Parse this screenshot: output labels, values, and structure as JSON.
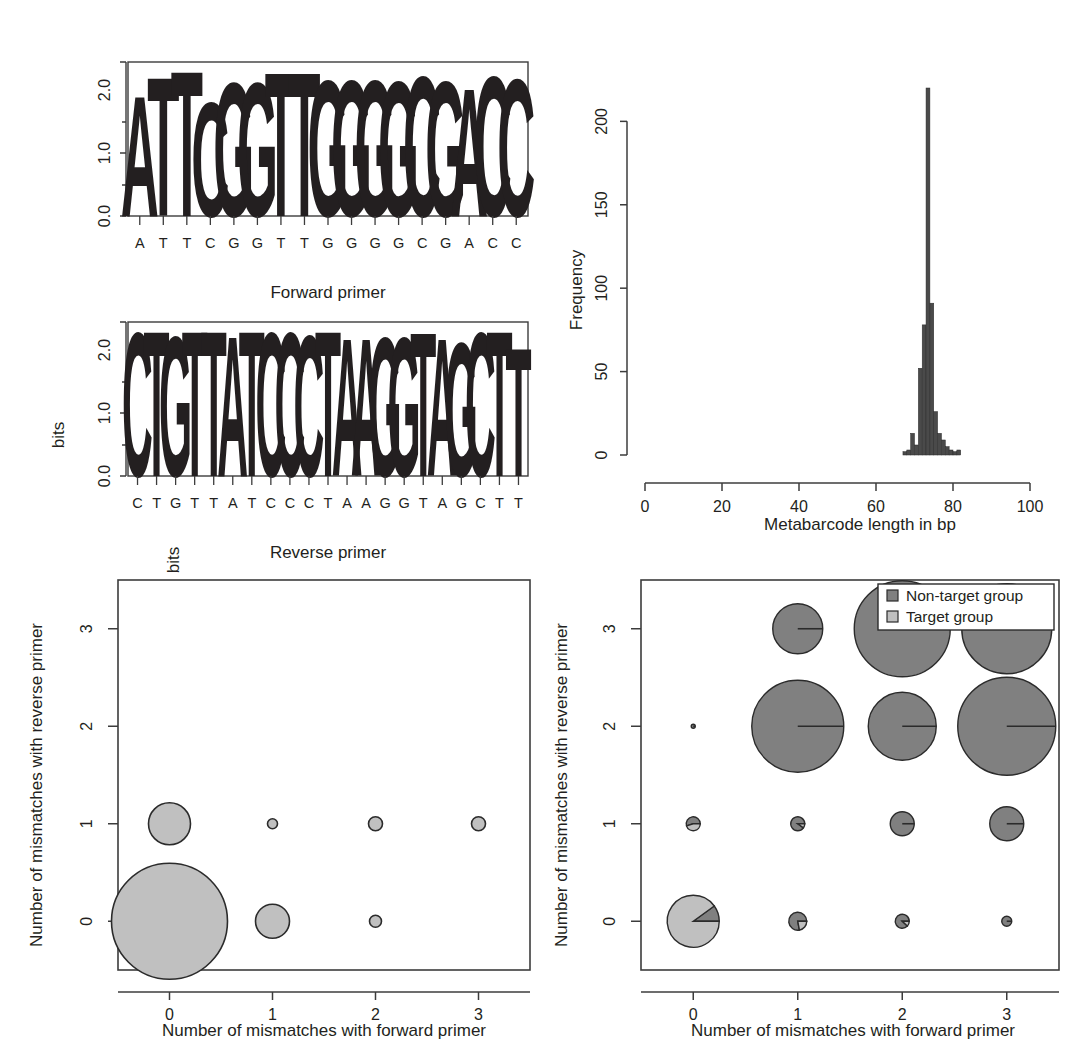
{
  "figure": {
    "panels": [
      "forward-primer-logo",
      "reverse-primer-logo",
      "metabarcode-length-histogram",
      "target-mismatch-bubble-plot",
      "all-taxa-mismatch-pie-plot"
    ]
  },
  "colors": {
    "nucleotide_a": "#c8c8c8",
    "nucleotide_c": "#3a3a3a",
    "nucleotide_g": "#b4b4b4",
    "nucleotide_t": "#6e6e6e",
    "target_group": "#c0c0c0",
    "non_target_group": "#808080",
    "outline": "#2b2b2b",
    "axis": "#3c3c3c",
    "histogram_bar": "#4a4a4a"
  },
  "chart_data": [
    {
      "type": "bar",
      "name": "forward-primer-logo",
      "title": "Forward primer",
      "xlabel": "",
      "ylabel": "bits",
      "ylim": [
        0,
        2.0
      ],
      "yticks": [
        "0.0",
        "1.0",
        "2.0"
      ],
      "categories": [
        "A",
        "T",
        "T",
        "C",
        "G",
        "G",
        "T",
        "T",
        "G",
        "G",
        "G",
        "G",
        "C",
        "G",
        "A",
        "C",
        "C"
      ],
      "values": [
        1.62,
        1.86,
        1.95,
        1.52,
        1.78,
        1.78,
        1.92,
        1.93,
        1.82,
        1.82,
        1.82,
        1.8,
        1.88,
        1.8,
        1.72,
        1.88,
        1.84
      ],
      "consensus": "ATTCGGTTGGGGCGACC"
    },
    {
      "type": "bar",
      "name": "reverse-primer-logo",
      "title": "Reverse primer",
      "xlabel": "",
      "ylabel": "bits",
      "ylim": [
        0,
        2.0
      ],
      "yticks": [
        "0.0",
        "1.0",
        "2.0"
      ],
      "categories": [
        "C",
        "T",
        "G",
        "T",
        "T",
        "A",
        "T",
        "C",
        "C",
        "C",
        "T",
        "A",
        "A",
        "G",
        "G",
        "T",
        "A",
        "G",
        "C",
        "T",
        "T"
      ],
      "values": [
        1.93,
        1.95,
        1.87,
        1.95,
        1.95,
        1.88,
        1.95,
        1.93,
        1.92,
        1.9,
        1.94,
        1.84,
        1.84,
        1.86,
        1.86,
        1.93,
        1.84,
        1.78,
        1.92,
        1.94,
        1.72
      ],
      "consensus": "CTGTTATCCCTAAGGTAGCTT"
    },
    {
      "type": "bar",
      "name": "metabarcode-length-histogram",
      "title": "",
      "xlabel": "Metabarcode length in bp",
      "ylabel": "Frequency",
      "xlim": [
        0,
        100
      ],
      "ylim": [
        0,
        220
      ],
      "xticks": [
        "0",
        "20",
        "40",
        "60",
        "80",
        "100"
      ],
      "yticks": [
        "0",
        "50",
        "100",
        "150",
        "200"
      ],
      "bin_width": 1,
      "bins": [
        67,
        68,
        69,
        70,
        71,
        72,
        73,
        74,
        75,
        76,
        77,
        78,
        79,
        80,
        81
      ],
      "values": [
        2,
        3,
        13,
        6,
        52,
        78,
        220,
        91,
        26,
        13,
        9,
        5,
        3,
        2,
        3
      ]
    },
    {
      "type": "scatter",
      "name": "target-mismatch-bubble-plot",
      "title": "",
      "xlabel": "Number of mismatches with forward primer",
      "ylabel": "Number of mismatches with reverse primer",
      "xlim": [
        -0.5,
        3.5
      ],
      "ylim": [
        -0.5,
        3.5
      ],
      "xticks": [
        "0",
        "1",
        "2",
        "3"
      ],
      "yticks": [
        "0",
        "1",
        "2",
        "3"
      ],
      "points": [
        {
          "x": 0,
          "y": 0,
          "r": 58
        },
        {
          "x": 1,
          "y": 0,
          "r": 17
        },
        {
          "x": 2,
          "y": 0,
          "r": 6
        },
        {
          "x": 0,
          "y": 1,
          "r": 21
        },
        {
          "x": 1,
          "y": 1,
          "r": 5
        },
        {
          "x": 2,
          "y": 1,
          "r": 7
        },
        {
          "x": 3,
          "y": 1,
          "r": 7
        }
      ]
    },
    {
      "type": "pie",
      "name": "all-taxa-mismatch-pie-plot",
      "title": "",
      "xlabel": "Number of mismatches with forward primer",
      "ylabel": "Number of mismatches with reverse primer",
      "xlim": [
        -0.5,
        3.5
      ],
      "ylim": [
        -0.5,
        3.5
      ],
      "xticks": [
        "0",
        "1",
        "2",
        "3"
      ],
      "yticks": [
        "0",
        "1",
        "2",
        "3"
      ],
      "legend_position": "top-right",
      "legend": [
        {
          "label": "Non-target group",
          "color": "#808080"
        },
        {
          "label": "Target group",
          "color": "#c0c0c0"
        }
      ],
      "points": [
        {
          "x": 0,
          "y": 0,
          "r": 26,
          "target_fraction": 0.9
        },
        {
          "x": 1,
          "y": 0,
          "r": 9,
          "target_fraction": 0.22
        },
        {
          "x": 2,
          "y": 0,
          "r": 7,
          "target_fraction": 0.12
        },
        {
          "x": 3,
          "y": 0,
          "r": 5,
          "target_fraction": 0.0
        },
        {
          "x": 0,
          "y": 1,
          "r": 7,
          "target_fraction": 0.45
        },
        {
          "x": 1,
          "y": 1,
          "r": 7,
          "target_fraction": 0.1
        },
        {
          "x": 2,
          "y": 1,
          "r": 12,
          "target_fraction": 0.0
        },
        {
          "x": 3,
          "y": 1,
          "r": 17,
          "target_fraction": 0.0
        },
        {
          "x": 0,
          "y": 2,
          "r": 2,
          "target_fraction": 0.0
        },
        {
          "x": 1,
          "y": 2,
          "r": 46,
          "target_fraction": 0.0
        },
        {
          "x": 2,
          "y": 2,
          "r": 34,
          "target_fraction": 0.0
        },
        {
          "x": 3,
          "y": 2,
          "r": 49,
          "target_fraction": 0.0
        },
        {
          "x": 1,
          "y": 3,
          "r": 25,
          "target_fraction": 0.0
        },
        {
          "x": 2,
          "y": 3,
          "r": 48,
          "target_fraction": 0.0
        },
        {
          "x": 3,
          "y": 3,
          "r": 45,
          "target_fraction": 0.0
        }
      ]
    }
  ]
}
